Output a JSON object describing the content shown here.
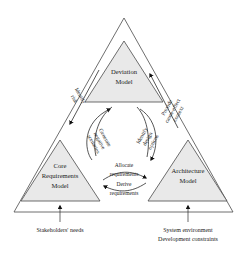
{
  "diagram": {
    "colors": {
      "shaded_fill": "#e9e9e9",
      "outline_stroke": "#4a4a4a",
      "curve_stroke": "#2b2b2b",
      "arrow_fill": "#111111",
      "background": "#ffffff",
      "text": "#1a1a1a"
    },
    "nodes": [
      {
        "id": "deviation-model",
        "lines": [
          "Deviation",
          "Model"
        ],
        "line1": "Deviation",
        "line2": "Model",
        "position": "top"
      },
      {
        "id": "core-requirements-model",
        "lines": [
          "Core",
          "Requirements",
          "Model"
        ],
        "line1": "Core",
        "line2": "Requirements",
        "line3": "Model",
        "position": "bottom-left"
      },
      {
        "id": "architecture-model",
        "lines": [
          "Architecture",
          "Model"
        ],
        "line1": "Architecture",
        "line2": "Model",
        "position": "bottom-right"
      }
    ],
    "edges": [
      {
        "id": "identify-risk",
        "line1": "Identify",
        "line2": "risk",
        "from": "deviation-model",
        "to": "core-requirements-model",
        "side": "outer-left"
      },
      {
        "id": "generate-negative-scenarios",
        "line1": "Generate",
        "line2": "negative",
        "line3": "scenarios",
        "from": "core-requirements-model",
        "to": "deviation-model",
        "side": "inner-left"
      },
      {
        "id": "identify-design-options",
        "line1": "Identify",
        "line2": "design",
        "line3": "options",
        "from": "deviation-model",
        "to": "architecture-model",
        "side": "inner-right"
      },
      {
        "id": "provide-cause-effect-context",
        "line1": "Provide",
        "line2": "cause-effect",
        "line3": "context",
        "from": "architecture-model",
        "to": "deviation-model",
        "side": "outer-right"
      },
      {
        "id": "allocate-requirements",
        "line1": "Allocate",
        "line2": "requirements",
        "from": "core-requirements-model",
        "to": "architecture-model",
        "side": "bottom-upper"
      },
      {
        "id": "derive-requirements",
        "line1": "Derive",
        "line2": "requirements",
        "from": "architecture-model",
        "to": "core-requirements-model",
        "side": "bottom-lower"
      }
    ],
    "captions": [
      {
        "id": "stakeholders-needs",
        "line1": "Stakeholders' needs",
        "target": "core-requirements-model"
      },
      {
        "id": "system-environment-development-constraints",
        "line1": "System environment",
        "line2": "Development constraints",
        "target": "architecture-model"
      }
    ]
  }
}
